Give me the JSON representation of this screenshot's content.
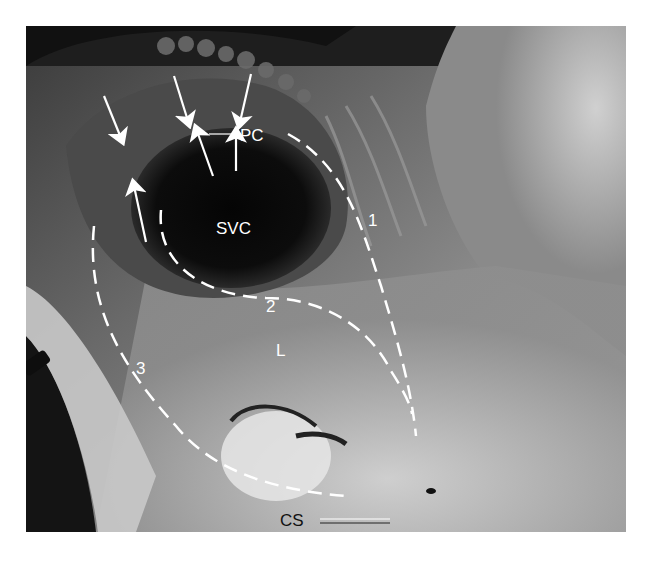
{
  "figure": {
    "labels": {
      "svc": "SVC",
      "pc": "PC",
      "l": "L",
      "cs": "CS",
      "line1": "1",
      "line2": "2",
      "line3": "3"
    },
    "colors": {
      "background": "#ffffff",
      "annotation": "#ffffff",
      "cs_label": "#111111"
    }
  }
}
